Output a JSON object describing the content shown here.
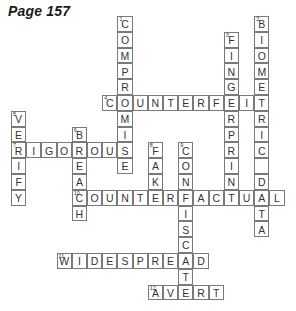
{
  "page": {
    "title": "Page 157"
  },
  "grid": {
    "origin_x": 11,
    "origin_y": 16,
    "cell_w": 15.2,
    "cell_h": 15.8,
    "line_color": "#7a7a7a",
    "letter_color": "#333333"
  },
  "entries": [
    {
      "number": 1,
      "answer": "COMPROMISE",
      "direction": "down",
      "row": 0,
      "col": 7
    },
    {
      "number": 2,
      "answer": "BIOMETRIC DATA",
      "direction": "down",
      "row": 0,
      "col": 16
    },
    {
      "number": 3,
      "answer": "FINGERPRINT",
      "direction": "down",
      "row": 1,
      "col": 14
    },
    {
      "number": 4,
      "answer": "COUNTERFEIT",
      "direction": "across",
      "row": 5,
      "col": 6
    },
    {
      "number": 5,
      "answer": "VERIFY",
      "direction": "down",
      "row": 6,
      "col": 0
    },
    {
      "number": 6,
      "answer": "BREACH",
      "direction": "down",
      "row": 7,
      "col": 4
    },
    {
      "number": 7,
      "answer": "RIGOROUS",
      "direction": "across",
      "row": 8,
      "col": 0
    },
    {
      "number": 8,
      "answer": "FAKE",
      "direction": "down",
      "row": 8,
      "col": 9
    },
    {
      "number": 9,
      "answer": "CONFISCATE",
      "direction": "down",
      "row": 8,
      "col": 11
    },
    {
      "number": 10,
      "answer": "COUNTERFACTUAL",
      "direction": "across",
      "row": 11,
      "col": 4
    },
    {
      "number": 11,
      "answer": "WIDESPREAD",
      "direction": "across",
      "row": 15,
      "col": 3
    },
    {
      "number": 12,
      "answer": "AVERT",
      "direction": "across",
      "row": 17,
      "col": 9
    }
  ]
}
